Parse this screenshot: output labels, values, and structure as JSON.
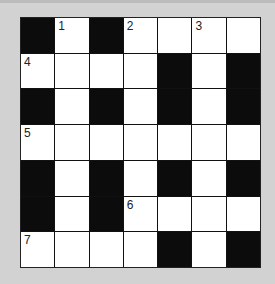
{
  "puzzle": {
    "rows": 7,
    "cols": 7,
    "grid": [
      [
        "B",
        "W",
        "B",
        "W",
        "W",
        "W",
        "W"
      ],
      [
        "W",
        "W",
        "W",
        "W",
        "B",
        "W",
        "B"
      ],
      [
        "B",
        "W",
        "B",
        "W",
        "B",
        "W",
        "B"
      ],
      [
        "W",
        "W",
        "W",
        "W",
        "W",
        "W",
        "W"
      ],
      [
        "B",
        "W",
        "B",
        "W",
        "B",
        "W",
        "B"
      ],
      [
        "B",
        "W",
        "B",
        "W",
        "W",
        "W",
        "W"
      ],
      [
        "W",
        "W",
        "W",
        "W",
        "B",
        "W",
        "B"
      ]
    ],
    "numbers": [
      {
        "row": 0,
        "col": 1,
        "label": "1"
      },
      {
        "row": 0,
        "col": 3,
        "label": "2"
      },
      {
        "row": 0,
        "col": 5,
        "label": "3"
      },
      {
        "row": 1,
        "col": 0,
        "label": "4"
      },
      {
        "row": 3,
        "col": 0,
        "label": "5"
      },
      {
        "row": 5,
        "col": 3,
        "label": "6"
      },
      {
        "row": 6,
        "col": 0,
        "label": "7"
      }
    ]
  },
  "colors": {
    "background": "#d2d2d2",
    "black_cell": "#0c0c0c",
    "white_cell": "#ffffff"
  }
}
